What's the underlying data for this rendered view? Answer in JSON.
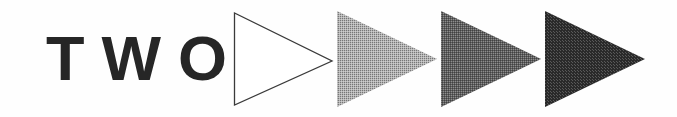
{
  "figure": {
    "background_color": "#fefefe",
    "width": 677,
    "height": 117,
    "caption_text": "TWO"
  },
  "wordmark": {
    "text": "TWO",
    "color": "#262626",
    "weight": "bold",
    "letter_spacing_px": 17,
    "font_size_px": 63
  },
  "triangles": [
    {
      "index": 1,
      "label": "outline-triangle",
      "shade_name": "white",
      "fill_color": "#ffffff",
      "stroke_color": "#3a3a3a",
      "stroke_width": 1.3,
      "dither_opacity": 0,
      "left_px": 233,
      "direction": "right"
    },
    {
      "index": 2,
      "label": "light-gray-triangle",
      "shade_name": "light gray",
      "fill_color": "#b5b5b5",
      "stroke_color": "none",
      "stroke_width": 0,
      "dither_opacity": 0.34,
      "left_px": 337,
      "direction": "right"
    },
    {
      "index": 3,
      "label": "medium-gray-triangle",
      "shade_name": "medium gray",
      "fill_color": "#5e5e5e",
      "stroke_color": "none",
      "stroke_width": 0,
      "dither_opacity": 0.3,
      "left_px": 441,
      "direction": "right"
    },
    {
      "index": 4,
      "label": "black-triangle",
      "shade_name": "black",
      "fill_color": "#2a2a2a",
      "stroke_color": "none",
      "stroke_width": 0,
      "dither_opacity": 0.22,
      "left_px": 545,
      "direction": "right"
    }
  ]
}
